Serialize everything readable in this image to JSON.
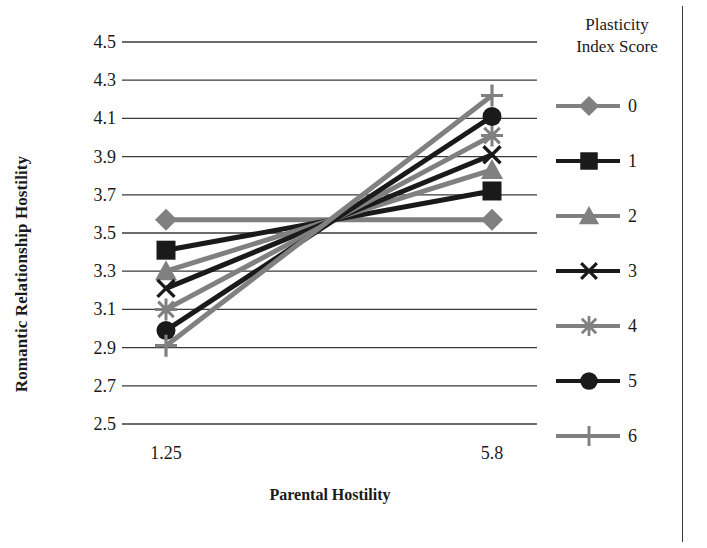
{
  "chart_data": {
    "type": "line",
    "title": "",
    "xlabel": "Parental Hostility",
    "ylabel": "Romantic Relationship Hostility",
    "x": [
      1.25,
      5.8
    ],
    "x_tick_labels": [
      "1.25",
      "5.8"
    ],
    "y_tick_labels": [
      "4.5",
      "4.3",
      "4.1",
      "3.9",
      "3.7",
      "3.5",
      "3.3",
      "3.1",
      "2.9",
      "2.7",
      "2.5"
    ],
    "y_ticks": [
      4.5,
      4.3,
      4.1,
      3.9,
      3.7,
      3.5,
      3.3,
      3.1,
      2.9,
      2.7,
      2.5
    ],
    "ylim": [
      2.5,
      4.5
    ],
    "grid": "horizontal",
    "legend_position": "right",
    "legend_title": "Plasticity\nIndex Score",
    "series": [
      {
        "name": "0",
        "marker": "diamond",
        "color": "#808080",
        "values": [
          3.57,
          3.57
        ]
      },
      {
        "name": "1",
        "marker": "square",
        "color": "#1a1a1a",
        "values": [
          3.41,
          3.72
        ]
      },
      {
        "name": "2",
        "marker": "triangle",
        "color": "#808080",
        "values": [
          3.3,
          3.83
        ]
      },
      {
        "name": "3",
        "marker": "x",
        "color": "#1a1a1a",
        "values": [
          3.21,
          3.91
        ]
      },
      {
        "name": "4",
        "marker": "asterisk",
        "color": "#808080",
        "values": [
          3.1,
          4.01
        ]
      },
      {
        "name": "5",
        "marker": "circle",
        "color": "#1a1a1a",
        "values": [
          2.99,
          4.11
        ]
      },
      {
        "name": "6",
        "marker": "plus",
        "color": "#808080",
        "values": [
          2.91,
          4.22
        ]
      }
    ]
  },
  "colors": {
    "gridline": "#3a3a3a",
    "series_gray": "#808080",
    "series_black": "#1a1a1a",
    "border": "#3a3a3a",
    "text": "#1a1a1a"
  }
}
